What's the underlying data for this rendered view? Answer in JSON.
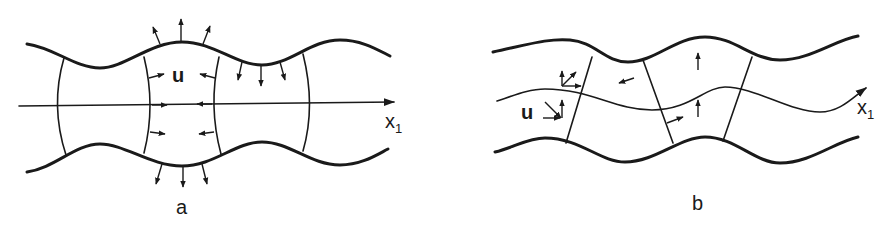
{
  "panels": [
    {
      "id": "a",
      "caption": "a",
      "vector_label": "u",
      "axis_label": "x",
      "axis_subscript": "1",
      "description": "Symmetric (sausage/varicose) mode: boundaries bulge outward and inward symmetrically about the x1 axis"
    },
    {
      "id": "b",
      "caption": "b",
      "vector_label": "u",
      "axis_label": "x",
      "axis_subscript": "1",
      "description": "Antisymmetric (flexural/kink) mode: boundaries and mid-line displace in the same direction"
    }
  ],
  "colors": {
    "ink": "#1a1a1a",
    "background": "#ffffff"
  }
}
